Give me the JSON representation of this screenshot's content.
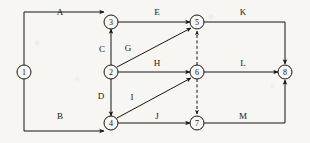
{
  "diagram": {
    "type": "directed-graph",
    "canvas": {
      "width": 310,
      "height": 143,
      "background": "#f7f6f3"
    },
    "stroke_color": "#171512",
    "nodes": [
      {
        "id": "1",
        "label": "1",
        "x": 24,
        "y": 72,
        "r": 7
      },
      {
        "id": "2",
        "label": "2",
        "x": 111,
        "y": 72,
        "r": 7
      },
      {
        "id": "3",
        "label": "3",
        "x": 111,
        "y": 22,
        "r": 7
      },
      {
        "id": "4",
        "label": "4",
        "x": 111,
        "y": 123,
        "r": 7
      },
      {
        "id": "5",
        "label": "5",
        "x": 197,
        "y": 22,
        "r": 7
      },
      {
        "id": "6",
        "label": "6",
        "x": 197,
        "y": 72,
        "r": 7
      },
      {
        "id": "7",
        "label": "7",
        "x": 197,
        "y": 123,
        "r": 7
      },
      {
        "id": "8",
        "label": "8",
        "x": 285,
        "y": 72,
        "r": 7
      }
    ],
    "edges": [
      {
        "id": "A",
        "label": "A",
        "from": "1",
        "to": "3",
        "style": "solid",
        "label_x": 60,
        "label_y": 12
      },
      {
        "id": "B",
        "label": "B",
        "from": "1",
        "to": "4",
        "style": "solid",
        "label_x": 60,
        "label_y": 116
      },
      {
        "id": "C",
        "label": "C",
        "from": "2",
        "to": "3",
        "style": "solid",
        "label_x": 102,
        "label_y": 49
      },
      {
        "id": "D",
        "label": "D",
        "from": "2",
        "to": "4",
        "style": "solid",
        "label_x": 101,
        "label_y": 96
      },
      {
        "id": "E",
        "label": "E",
        "from": "3",
        "to": "5",
        "style": "solid",
        "label_x": 157,
        "label_y": 12
      },
      {
        "id": "G",
        "label": "G",
        "from": "2",
        "to": "5",
        "style": "solid",
        "label_x": 128,
        "label_y": 48
      },
      {
        "id": "H",
        "label": "H",
        "from": "2",
        "to": "6",
        "style": "solid",
        "label_x": 157,
        "label_y": 63
      },
      {
        "id": "I",
        "label": "I",
        "from": "4",
        "to": "6",
        "style": "solid",
        "label_x": 132,
        "label_y": 97
      },
      {
        "id": "J",
        "label": "J",
        "from": "4",
        "to": "7",
        "style": "solid",
        "label_x": 157,
        "label_y": 116
      },
      {
        "id": "K",
        "label": "K",
        "from": "5",
        "to": "8",
        "style": "solid",
        "label_x": 243,
        "label_y": 12
      },
      {
        "id": "L",
        "label": "L",
        "from": "6",
        "to": "8",
        "style": "solid",
        "label_x": 243,
        "label_y": 63
      },
      {
        "id": "M",
        "label": "M",
        "from": "7",
        "to": "8",
        "style": "solid",
        "label_x": 243,
        "label_y": 116
      },
      {
        "id": "dummy65",
        "label": "",
        "from": "6",
        "to": "5",
        "style": "dashed",
        "label_x": 0,
        "label_y": 0
      },
      {
        "id": "dummy67",
        "label": "",
        "from": "6",
        "to": "7",
        "style": "dashed",
        "label_x": 0,
        "label_y": 0
      }
    ]
  }
}
